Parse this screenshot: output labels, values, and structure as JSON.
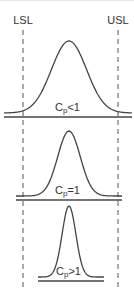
{
  "diagram": {
    "type": "process-capability-comparison",
    "limits": {
      "lower": {
        "label": "LSL",
        "x": 23
      },
      "upper": {
        "label": "USL",
        "x": 118
      }
    },
    "panels": [
      {
        "id": "cp-less-than-1",
        "base": "C",
        "subscript": "p",
        "relation": "<1",
        "peak_y": 41,
        "baseline_y": 117,
        "baseline_x": [
          4,
          132
        ],
        "spread": 28
      },
      {
        "id": "cp-equal-1",
        "base": "C",
        "subscript": "p",
        "relation": "=1",
        "peak_y": 131,
        "baseline_y": 200,
        "baseline_x": [
          16,
          122
        ],
        "spread": 18
      },
      {
        "id": "cp-greater-than-1",
        "base": "C",
        "subscript": "p",
        "relation": ">1",
        "peak_y": 206,
        "baseline_y": 281,
        "baseline_x": [
          38,
          104
        ],
        "spread": 11
      }
    ],
    "center_x": 69,
    "colors": {
      "stroke": "#444444",
      "text": "#333333",
      "background": "#ffffff"
    }
  }
}
